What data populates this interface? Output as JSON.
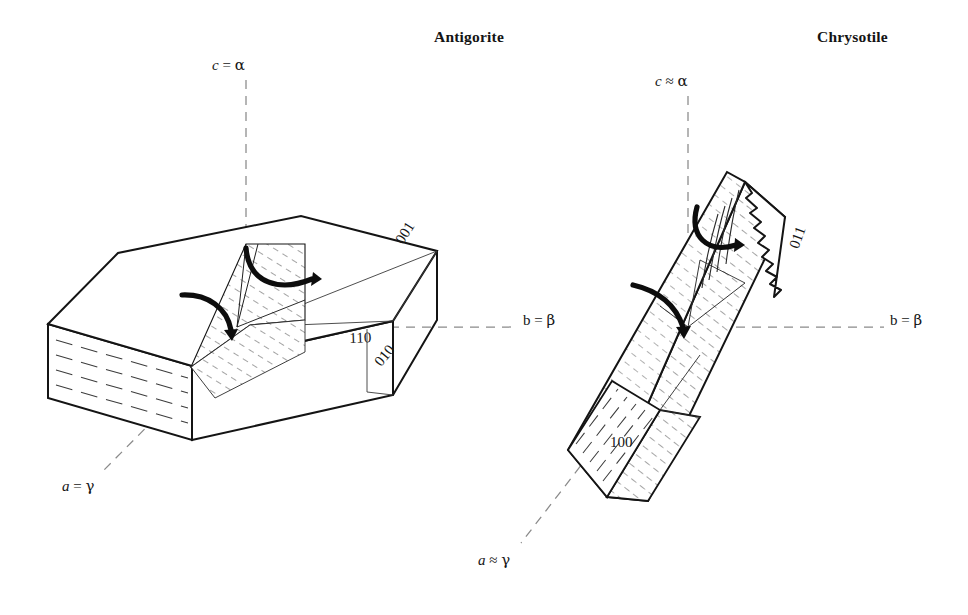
{
  "figure": {
    "domain": "crystallographic-optical-orientation-diagram",
    "background_color": "#ffffff",
    "line_color": "#141414",
    "hatch_color": "#4a4a4a",
    "dash_color": "#7a7a7a"
  },
  "panels": [
    {
      "id": "antigorite",
      "title": "Antigorite",
      "habit": "tabular pseudohexagonal platy crystal",
      "axes": [
        {
          "name": "c-axis",
          "label_parts": {
            "axis": "c",
            "relation": "=",
            "index": "α"
          },
          "label_text": "c = α",
          "style": "italic-roman",
          "orientation": "vertical"
        },
        {
          "name": "b-axis",
          "label_parts": {
            "axis": "b",
            "relation": "=",
            "index": "β"
          },
          "label_text": "b = β",
          "style": "upright-roman",
          "orientation": "horizontal"
        },
        {
          "name": "a-axis",
          "label_parts": {
            "axis": "a",
            "relation": "=",
            "index": "γ"
          },
          "label_text": "a = γ",
          "style": "italic-roman",
          "orientation": "oblique-front"
        }
      ],
      "miller_indices": [
        {
          "id": "001",
          "text": "001",
          "face": "basal pinacoid / top face"
        },
        {
          "id": "110",
          "text": "110",
          "face": "prism"
        },
        {
          "id": "010",
          "text": "010",
          "face": "side pinacoid"
        }
      ],
      "arrows": [
        {
          "id": "upper-curved-arrow",
          "meaning": "optic-orientation-rotation"
        },
        {
          "id": "lower-curved-arrow",
          "meaning": "optic-orientation-rotation"
        }
      ],
      "features": [
        "cleavage traces on front face",
        "hatched internal section plane"
      ]
    },
    {
      "id": "chrysotile",
      "title": "Chrysotile",
      "habit": "elongate fibrous prismatic crystal with frayed fibre termination",
      "axes": [
        {
          "name": "c-axis",
          "label_parts": {
            "axis": "c",
            "relation": "≈",
            "index": "α"
          },
          "label_text": "c ≈ α",
          "style": "italic-roman",
          "orientation": "vertical"
        },
        {
          "name": "b-axis",
          "label_parts": {
            "axis": "b",
            "relation": "=",
            "index": "β"
          },
          "label_text": "b = β",
          "style": "upright-roman",
          "orientation": "horizontal"
        },
        {
          "name": "a-axis",
          "label_parts": {
            "axis": "a",
            "relation": "≈",
            "index": "γ"
          },
          "label_text": "a ≈ γ",
          "style": "italic-roman",
          "orientation": "oblique-front"
        }
      ],
      "miller_indices": [
        {
          "id": "011",
          "text": "011",
          "face": "prism"
        },
        {
          "id": "100",
          "text": "100",
          "face": "front pinacoid"
        }
      ],
      "arrows": [
        {
          "id": "upper-curved-arrow",
          "meaning": "optic-orientation-rotation"
        },
        {
          "id": "lower-curved-arrow",
          "meaning": "optic-orientation-rotation"
        }
      ],
      "features": [
        "fibrous serrated top termination",
        "hatched fibre body",
        "cleavage traces on lower-left face",
        "wedge-shaped bottom termination"
      ]
    }
  ]
}
